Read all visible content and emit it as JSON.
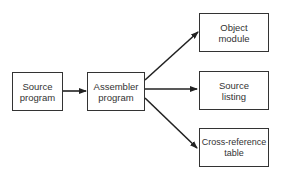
{
  "diagram": {
    "type": "flowchart",
    "nodes": [
      {
        "id": "source-program",
        "lines": [
          "Source",
          "program"
        ]
      },
      {
        "id": "assembler-program",
        "lines": [
          "Assembler",
          "program"
        ]
      },
      {
        "id": "object-module",
        "lines": [
          "Object",
          "module"
        ]
      },
      {
        "id": "source-listing",
        "lines": [
          "Source",
          "listing"
        ]
      },
      {
        "id": "cross-reference-table",
        "lines": [
          "Cross-reference",
          "table"
        ]
      }
    ],
    "edges": [
      {
        "from": "source-program",
        "to": "assembler-program"
      },
      {
        "from": "assembler-program",
        "to": "object-module"
      },
      {
        "from": "assembler-program",
        "to": "source-listing"
      },
      {
        "from": "assembler-program",
        "to": "cross-reference-table"
      }
    ],
    "colors": {
      "stroke": "#222222",
      "text": "#333333",
      "background": "#ffffff"
    }
  }
}
